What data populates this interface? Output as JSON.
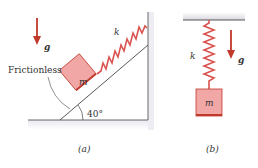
{
  "figure_a": {
    "caption": "(a)",
    "surface_label": "Frictionless",
    "angle_label": "40°",
    "spring_label": "k",
    "mass_label": "m",
    "gravity_label": "g"
  },
  "figure_b": {
    "caption": "(b)",
    "spring_label": "k",
    "mass_label": "m",
    "gravity_label": "g"
  },
  "colors": {
    "spring": "#d9534f",
    "mass_fill": "#f2a7a7",
    "mass_edge": "#c0392b",
    "arrow": "#c0392b",
    "ground_shade": "#e6e3ee",
    "line": "#444444"
  }
}
